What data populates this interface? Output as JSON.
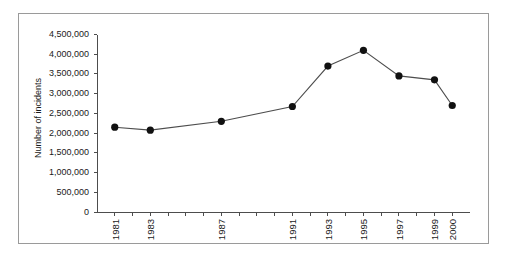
{
  "chart_data": {
    "type": "line",
    "title": "",
    "xlabel": "",
    "ylabel": "Number of incidents",
    "categories": [
      "1981",
      "1983",
      "1987",
      "1991",
      "1993",
      "1995",
      "1997",
      "1999",
      "2000"
    ],
    "x_positions": [
      1981,
      1983,
      1987,
      1991,
      1993,
      1995,
      1997,
      1999,
      2000
    ],
    "values": [
      2150000,
      2075000,
      2300000,
      2675000,
      3700000,
      4100000,
      3450000,
      3350000,
      2700000
    ],
    "series": [
      {
        "name": "Number of incidents",
        "values": [
          2150000,
          2075000,
          2300000,
          2675000,
          3700000,
          4100000,
          3450000,
          3350000,
          2700000
        ]
      }
    ],
    "ylim": [
      0,
      4500000
    ],
    "xlim": [
      1980,
      2001
    ],
    "ytick_values": [
      0,
      500000,
      1000000,
      1500000,
      2000000,
      2500000,
      3000000,
      3500000,
      4000000,
      4500000
    ],
    "ytick_labels": [
      "0",
      "500,000",
      "1,000,000",
      "1,500,000",
      "2,000,000",
      "2,500,000",
      "3,000,000",
      "3,500,000",
      "4,000,000",
      "4,500,000"
    ],
    "xtick_minor_years": [
      1980,
      1981,
      1982,
      1983,
      1984,
      1985,
      1986,
      1987,
      1988,
      1989,
      1990,
      1991,
      1992,
      1993,
      1994,
      1995,
      1996,
      1997,
      1998,
      1999,
      2000,
      2001
    ],
    "grid": false,
    "legend": null,
    "legend_position": "none",
    "marker": "filled-circle",
    "line_color": "#4d4d4d",
    "marker_color": "#111111",
    "axis_color": "#4d4d4d",
    "frame_color": "#9a9a9a",
    "background": "#ffffff"
  }
}
